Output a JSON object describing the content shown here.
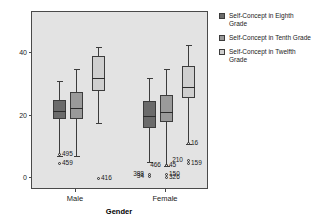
{
  "chart_data": {
    "type": "box",
    "title": "",
    "xlabel": "Gender",
    "ylabel": "",
    "ylim": [
      -4,
      46
    ],
    "yticks": [
      0,
      20,
      40
    ],
    "ytick_labels": [
      "0",
      "20",
      "40"
    ],
    "categories": [
      "Male",
      "Female"
    ],
    "grid": false,
    "legend_position": "right",
    "series": [
      {
        "name": "Self-Concept in Eighth Grade",
        "color": "#6b6b6b",
        "boxes": [
          {
            "category": "Male",
            "whisker_low": 7.0,
            "q1": 19.0,
            "median": 21.5,
            "q3": 25.0,
            "whisker_high": 31.0,
            "outliers": [
              {
                "label": "495",
                "value": 7.5
              },
              {
                "label": "459",
                "value": 4.5
              }
            ]
          },
          {
            "category": "Female",
            "whisker_low": 5.0,
            "q1": 16.0,
            "median": 20.0,
            "q3": 24.5,
            "whisker_high": 32.0,
            "outliers": [
              {
                "label": "388",
                "value": 1.2
              },
              {
                "label": "34",
                "value": 0.4
              }
            ]
          }
        ]
      },
      {
        "name": "Self-Concept in Tenth Grade",
        "color": "#9a9a9a",
        "boxes": [
          {
            "category": "Male",
            "whisker_low": 7.0,
            "q1": 19.0,
            "median": 22.5,
            "q3": 27.5,
            "whisker_high": 35.0,
            "outliers": []
          },
          {
            "category": "Female",
            "whisker_low": 4.0,
            "q1": 18.0,
            "median": 21.0,
            "q3": 26.5,
            "whisker_high": 35.0,
            "outliers": [
              {
                "label": "466",
                "value": 4.0
              },
              {
                "label": "45",
                "value": 4.0
              },
              {
                "label": "150",
                "value": 1.0
              },
              {
                "label": "326",
                "value": 0.3
              }
            ]
          }
        ]
      },
      {
        "name": "Self-Concept in Twelfth Grade",
        "color": "#cfcfcf",
        "boxes": [
          {
            "category": "Male",
            "whisker_low": 17.5,
            "q1": 28.0,
            "median": 32.0,
            "q3": 39.0,
            "whisker_high": 42.0,
            "outliers": [
              {
                "label": "416",
                "value": 0.0
              }
            ]
          },
          {
            "category": "Female",
            "whisker_low": 11.0,
            "q1": 25.5,
            "median": 29.0,
            "q3": 36.0,
            "whisker_high": 42.5,
            "outliers": [
              {
                "label": "16",
                "value": 11.0
              },
              {
                "label": "210",
                "value": 5.5
              },
              {
                "label": "159",
                "value": 4.5
              }
            ]
          }
        ]
      }
    ]
  },
  "legend": {
    "items": [
      {
        "label": "Self-Concept in Eighth Grade",
        "color": "#6b6b6b"
      },
      {
        "label": "Self-Concept in Tenth Grade",
        "color": "#9a9a9a"
      },
      {
        "label": "Self-Concept in Twelfth Grade",
        "color": "#cfcfcf"
      }
    ]
  },
  "axes": {
    "x_title": "Gender",
    "x_tick_labels": [
      "Male",
      "Female"
    ],
    "y_tick_labels": [
      "0",
      "20",
      "40"
    ]
  }
}
